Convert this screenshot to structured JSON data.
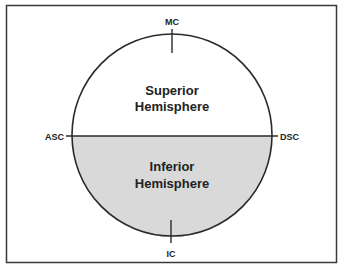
{
  "diagram": {
    "top_label": "MC",
    "bottom_label": "IC",
    "left_label": "ASC",
    "right_label": "DSC",
    "upper_region": {
      "line1": "Superior",
      "line2": "Hemisphere",
      "fill": "#ffffff"
    },
    "lower_region": {
      "line1": "Inferior",
      "line2": "Hemisphere",
      "fill": "#d9d9d9"
    }
  },
  "colors": {
    "stroke": "#2a2a2a",
    "frame": "#3a3a3a"
  }
}
